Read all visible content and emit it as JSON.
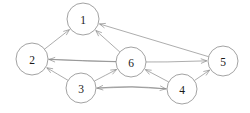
{
  "figure": {
    "kind": "directed-graph",
    "background_color": "#ffffff",
    "stroke_color": "#8a8a8a",
    "label_color": "#1a1a1a",
    "node_fill": "#ffffff"
  },
  "nodes": [
    {
      "id": "1",
      "label": "1",
      "cx": 83,
      "cy": 19,
      "r": 16
    },
    {
      "id": "2",
      "label": "2",
      "cx": 32,
      "cy": 59,
      "r": 16
    },
    {
      "id": "3",
      "label": "3",
      "cx": 81,
      "cy": 88,
      "r": 15
    },
    {
      "id": "4",
      "label": "4",
      "cx": 182,
      "cy": 89,
      "r": 15
    },
    {
      "id": "5",
      "label": "5",
      "cx": 223,
      "cy": 61,
      "r": 15
    },
    {
      "id": "6",
      "label": "6",
      "cx": 131,
      "cy": 62,
      "r": 15
    }
  ],
  "edges": [
    {
      "id": "e-2-1",
      "from": "2",
      "to": "1",
      "directed": true
    },
    {
      "id": "e-6-1",
      "from": "6",
      "to": "1",
      "directed": true
    },
    {
      "id": "e-5-1",
      "from": "5",
      "to": "1",
      "directed": true
    },
    {
      "id": "e-6-2",
      "from": "6",
      "to": "2",
      "directed": true
    },
    {
      "id": "e-3-2",
      "from": "3",
      "to": "2",
      "directed": true
    },
    {
      "id": "e-2-5",
      "from": "2",
      "to": "5",
      "directed": true
    },
    {
      "id": "e-3-6",
      "from": "3",
      "to": "6",
      "directed": true
    },
    {
      "id": "e-4-6",
      "from": "4",
      "to": "6",
      "directed": true
    },
    {
      "id": "e-3-4",
      "from": "3",
      "to": "4",
      "directed": true
    },
    {
      "id": "e-4-3",
      "from": "4",
      "to": "3",
      "directed": true
    },
    {
      "id": "e-4-5",
      "from": "4",
      "to": "5",
      "directed": true
    }
  ]
}
